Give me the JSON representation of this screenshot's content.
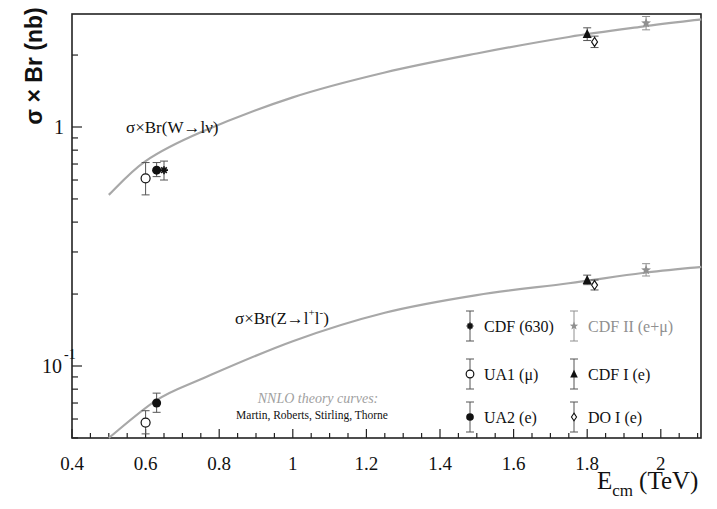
{
  "chart_data": {
    "type": "scatter",
    "title": "",
    "xlabel": "E_cm (TeV)",
    "xlabel_main": "E",
    "xlabel_sub": "cm",
    "xlabel_unit": "(TeV)",
    "ylabel": "σ × Br (nb)",
    "yscale": "log",
    "xlim": [
      0.4,
      2.11
    ],
    "ylim": [
      0.05,
      2.97
    ],
    "grid": false,
    "x_ticks": [
      0.4,
      0.6,
      0.8,
      1.0,
      1.2,
      1.4,
      1.6,
      1.8,
      2.0
    ],
    "x_tick_labels": [
      "0.4",
      "0.6",
      "0.8",
      "1",
      "1.2",
      "1.4",
      "1.6",
      "1.8",
      "2"
    ],
    "y_tick_labels": [
      {
        "value": 1,
        "base": "1",
        "exp": ""
      },
      {
        "value": 0.1,
        "base": "10",
        "exp": "-1"
      }
    ],
    "curve_labels": {
      "w": "σ×Br(W→lν)",
      "z_prefix": "σ×Br(Z→l",
      "z_sup1": "+",
      "z_mid": "l",
      "z_sup2": "-",
      "z_suffix": ")"
    },
    "theory_note": {
      "line1": "NNLO theory curves:",
      "line2": "Martin, Roberts, Stirling, Thorne"
    },
    "curves": [
      {
        "name": "W→lν NNLO",
        "color": "#a8a8a8",
        "x": [
          0.5,
          0.6,
          0.75,
          1.0,
          1.25,
          1.5,
          1.75,
          1.95,
          2.11
        ],
        "y": [
          0.52,
          0.72,
          0.95,
          1.33,
          1.69,
          2.03,
          2.38,
          2.63,
          2.82
        ]
      },
      {
        "name": "Z→l+l- NNLO",
        "color": "#a8a8a8",
        "x": [
          0.5,
          0.63,
          0.75,
          1.0,
          1.25,
          1.5,
          1.75,
          1.95,
          2.11
        ],
        "y": [
          0.05,
          0.072,
          0.088,
          0.127,
          0.167,
          0.198,
          0.222,
          0.245,
          0.26
        ]
      }
    ],
    "legend": {
      "position": "lower right",
      "entries": [
        {
          "label": "CDF (630)",
          "marker": "asterisk",
          "color": "#111111"
        },
        {
          "label": "CDF II (e+μ)",
          "marker": "star",
          "color": "#909090"
        },
        {
          "label": "UA1 (μ)",
          "marker": "open-circle",
          "color": "#111111"
        },
        {
          "label": "CDF I (e)",
          "marker": "filled-triangle",
          "color": "#111111"
        },
        {
          "label": "UA2 (e)",
          "marker": "filled-circle",
          "color": "#111111"
        },
        {
          "label": "DO I (e)",
          "marker": "open-diamond",
          "color": "#111111"
        }
      ]
    },
    "series": [
      {
        "name": "UA1 (μ)",
        "marker": "open-circle",
        "color": "#111111",
        "points": [
          {
            "process": "W",
            "x": 0.6,
            "y": 0.61,
            "ylo": 0.52,
            "yhi": 0.71
          },
          {
            "process": "Z",
            "x": 0.6,
            "y": 0.058,
            "ylo": 0.052,
            "yhi": 0.065
          }
        ]
      },
      {
        "name": "UA2 (e)",
        "marker": "filled-circle",
        "color": "#111111",
        "points": [
          {
            "process": "W",
            "x": 0.63,
            "y": 0.66,
            "ylo": 0.62,
            "yhi": 0.71
          },
          {
            "process": "Z",
            "x": 0.63,
            "y": 0.07,
            "ylo": 0.064,
            "yhi": 0.077
          }
        ]
      },
      {
        "name": "CDF (630)",
        "marker": "asterisk",
        "color": "#111111",
        "points": [
          {
            "process": "W",
            "x": 0.65,
            "y": 0.66,
            "ylo": 0.6,
            "yhi": 0.72
          }
        ]
      },
      {
        "name": "CDF I (e)",
        "marker": "filled-triangle",
        "color": "#111111",
        "points": [
          {
            "process": "W",
            "x": 1.8,
            "y": 2.45,
            "ylo": 2.3,
            "yhi": 2.6
          },
          {
            "process": "Z",
            "x": 1.8,
            "y": 0.229,
            "ylo": 0.219,
            "yhi": 0.24
          }
        ]
      },
      {
        "name": "DO I (e)",
        "marker": "open-diamond",
        "color": "#111111",
        "points": [
          {
            "process": "W",
            "x": 1.82,
            "y": 2.27,
            "ylo": 2.15,
            "yhi": 2.4
          },
          {
            "process": "Z",
            "x": 1.82,
            "y": 0.218,
            "ylo": 0.208,
            "yhi": 0.229
          }
        ]
      },
      {
        "name": "CDF II (e+μ)",
        "marker": "star",
        "color": "#909090",
        "points": [
          {
            "process": "W",
            "x": 1.96,
            "y": 2.72,
            "ylo": 2.55,
            "yhi": 2.9
          },
          {
            "process": "Z",
            "x": 1.96,
            "y": 0.252,
            "ylo": 0.238,
            "yhi": 0.268
          }
        ]
      }
    ]
  }
}
